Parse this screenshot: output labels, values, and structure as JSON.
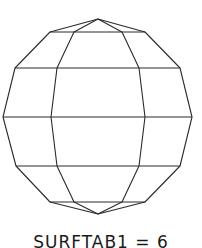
{
  "figure": {
    "caption": "SURFTAB1 = 6",
    "stroke_color": "#2a2a2a",
    "background": "#ffffff",
    "shape": "faceted-sphere-wireframe"
  }
}
